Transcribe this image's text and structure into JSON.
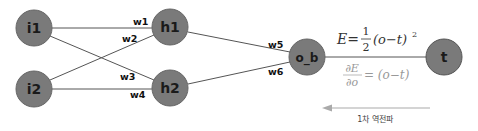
{
  "diagram": {
    "nodes": [
      {
        "id": "i1",
        "label": "i1"
      },
      {
        "id": "i2",
        "label": "i2"
      },
      {
        "id": "h1",
        "label": "h1"
      },
      {
        "id": "h2",
        "label": "h2"
      },
      {
        "id": "o_b",
        "label": "o_b"
      },
      {
        "id": "t",
        "label": "t"
      }
    ],
    "weights": {
      "w1": "w1",
      "w2": "w2",
      "w3": "w3",
      "w4": "w4",
      "w5": "w5",
      "w6": "w6"
    },
    "formulas": {
      "error_lhs": "E=",
      "error_num": "1",
      "error_den": "2",
      "error_rhs": "(o−t)",
      "error_exp": "2",
      "deriv_num": "∂E",
      "deriv_den": "∂o",
      "deriv_rhs": "= (o−t)"
    },
    "caption": "1차 역전파",
    "colors": {
      "node_fill": "#7a7a7a",
      "node_stroke": "#5e5e5e",
      "edge": "#555555",
      "arrow": "#aaaaaa"
    }
  }
}
